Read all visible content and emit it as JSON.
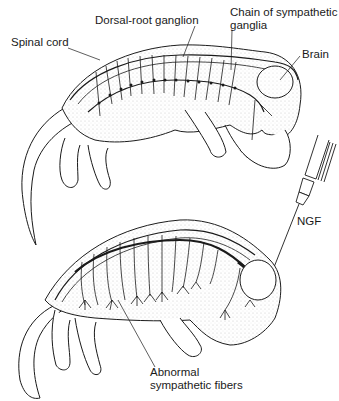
{
  "figure": {
    "top_panel": {
      "description": "Normal embryo: sympathetic innervation",
      "labels": {
        "spinal_cord": "Spinal cord",
        "dorsal_root_ganglion": "Dorsal-root ganglion",
        "chain_line1": "Chain of sympathetic",
        "chain_line2": "ganglia",
        "brain": "Brain"
      }
    },
    "bottom_panel": {
      "description": "Embryo injected with NGF: abnormal sympathetic fibers",
      "labels": {
        "ngf": "NGF",
        "abnormal_line1": "Abnormal",
        "abnormal_line2": "sympathetic fibers"
      }
    },
    "colors": {
      "ink": "#1a1a1a",
      "stipple": "#9a9a9a",
      "background": "#ffffff"
    }
  }
}
